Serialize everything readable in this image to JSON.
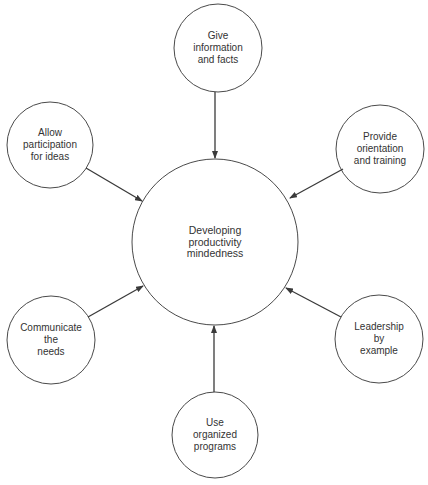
{
  "diagram": {
    "type": "hub-and-spoke",
    "center": {
      "id": "center",
      "lines": [
        "Developing",
        "productivity",
        "mindedness"
      ],
      "cx": 215,
      "cy": 242,
      "r": 83
    },
    "nodes": [
      {
        "id": "top",
        "lines": [
          "Give",
          "information",
          "and facts"
        ],
        "cx": 218,
        "cy": 48,
        "r": 44
      },
      {
        "id": "top-right",
        "lines": [
          "Provide",
          "orientation",
          "and training"
        ],
        "cx": 380,
        "cy": 149,
        "r": 44
      },
      {
        "id": "bottom-right",
        "lines": [
          "Leadership",
          "by",
          "example"
        ],
        "cx": 379,
        "cy": 339,
        "r": 44
      },
      {
        "id": "bottom",
        "lines": [
          "Use",
          "organized",
          "programs"
        ],
        "cx": 215,
        "cy": 435,
        "r": 43
      },
      {
        "id": "bottom-left",
        "lines": [
          "Communicate",
          "the",
          "needs"
        ],
        "cx": 51,
        "cy": 340,
        "r": 44
      },
      {
        "id": "top-left",
        "lines": [
          "Allow",
          "participation",
          "for ideas"
        ],
        "cx": 50,
        "cy": 145,
        "r": 43
      }
    ],
    "arrows": [
      {
        "from": "top",
        "to": "center",
        "x1": 215,
        "y1": 92,
        "x2": 215,
        "y2": 158
      },
      {
        "from": "top-right",
        "to": "center",
        "x1": 343,
        "y1": 169,
        "x2": 290,
        "y2": 198
      },
      {
        "from": "bottom-right",
        "to": "center",
        "x1": 341,
        "y1": 317,
        "x2": 286,
        "y2": 288
      },
      {
        "from": "bottom",
        "to": "center",
        "x1": 214,
        "y1": 392,
        "x2": 214,
        "y2": 326
      },
      {
        "from": "bottom-left",
        "to": "center",
        "x1": 88,
        "y1": 317,
        "x2": 143,
        "y2": 286
      },
      {
        "from": "top-left",
        "to": "center",
        "x1": 86,
        "y1": 168,
        "x2": 142,
        "y2": 201
      }
    ],
    "colors": {
      "stroke": "#4a4a4a",
      "text": "#333333",
      "background": "#ffffff"
    }
  }
}
